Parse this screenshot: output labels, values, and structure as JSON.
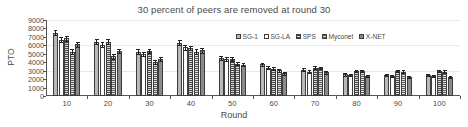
{
  "chart_data": {
    "type": "bar",
    "title": "30 percent of peers are removed at round 30",
    "xlabel": "Round",
    "ylabel": "PTO",
    "categories": [
      "10",
      "20",
      "30",
      "40",
      "50",
      "60",
      "70",
      "80",
      "90",
      "100"
    ],
    "ylim": [
      0,
      9000
    ],
    "yticks": [
      0,
      1000,
      2000,
      3000,
      4000,
      5000,
      6000,
      7000,
      8000,
      9000
    ],
    "grid": true,
    "legend_position": "upper right (inside plot)",
    "series": [
      {
        "name": "SG-1",
        "color": "#b8b8b8",
        "values": [
          7500,
          6450,
          5250,
          6300,
          4550,
          3750,
          3100,
          2550,
          2500,
          2500
        ],
        "errors": [
          330,
          300,
          270,
          300,
          230,
          210,
          180,
          150,
          140,
          140
        ]
      },
      {
        "name": "SG-LA",
        "color": "#fdfdfd",
        "values": [
          6650,
          6100,
          5000,
          5750,
          4350,
          3350,
          2900,
          2450,
          2400,
          2400
        ],
        "errors": [
          300,
          280,
          250,
          280,
          220,
          200,
          170,
          140,
          130,
          130
        ]
      },
      {
        "name": "SPS",
        "color": "#7d7d7d",
        "values": [
          6850,
          6450,
          5300,
          5700,
          4350,
          3250,
          3350,
          3000,
          2950,
          2950
        ],
        "errors": [
          300,
          290,
          260,
          270,
          210,
          190,
          170,
          130,
          120,
          120
        ]
      },
      {
        "name": "Myconet",
        "color": "#8f8f8f",
        "values": [
          5250,
          4700,
          4050,
          5250,
          3850,
          3050,
          3300,
          2950,
          2900,
          2900
        ],
        "errors": [
          280,
          260,
          240,
          270,
          200,
          180,
          160,
          120,
          120,
          120
        ]
      },
      {
        "name": "X-NET",
        "color": "#8a8a8a",
        "values": [
          6150,
          5350,
          4400,
          5400,
          3700,
          2700,
          2800,
          2350,
          2250,
          2250
        ],
        "errors": [
          290,
          270,
          250,
          270,
          190,
          170,
          150,
          110,
          110,
          110
        ]
      }
    ]
  }
}
